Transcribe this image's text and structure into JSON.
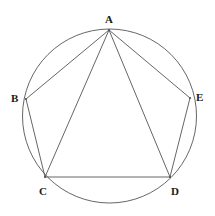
{
  "figure": {
    "type": "geometric-diagram",
    "canvas": {
      "width": 215,
      "height": 216
    },
    "stroke_color": "#555555",
    "label_color": "#1a1a1a",
    "background_color": "#ffffff",
    "stroke_width": 0.9,
    "circle": {
      "name": "circumscribed-circle",
      "center_x": 109.5,
      "center_y": 116,
      "radius": 87,
      "fill": "none"
    },
    "vertices": [
      {
        "id": "A",
        "label": "A",
        "x": 109,
        "y": 30,
        "label_x": 105,
        "label_y": 14,
        "position": "top"
      },
      {
        "id": "B",
        "label": "B",
        "x": 26,
        "y": 99,
        "label_x": 11,
        "label_y": 93,
        "position": "left"
      },
      {
        "id": "C",
        "label": "C",
        "x": 45,
        "y": 177,
        "label_x": 39,
        "label_y": 186,
        "position": "bottom-left"
      },
      {
        "id": "D",
        "label": "D",
        "x": 170,
        "y": 177,
        "label_x": 171,
        "label_y": 186,
        "position": "bottom-right"
      },
      {
        "id": "E",
        "label": "E",
        "x": 190,
        "y": 98,
        "label_x": 196,
        "label_y": 92,
        "position": "right"
      }
    ],
    "segments": [
      {
        "name": "side-AB",
        "from": "A",
        "to": "B",
        "kind": "pentagon-side"
      },
      {
        "name": "side-BC",
        "from": "B",
        "to": "C",
        "kind": "pentagon-side"
      },
      {
        "name": "side-CD",
        "from": "C",
        "to": "D",
        "kind": "pentagon-side"
      },
      {
        "name": "side-DE",
        "from": "D",
        "to": "E",
        "kind": "pentagon-side"
      },
      {
        "name": "side-EA",
        "from": "E",
        "to": "A",
        "kind": "pentagon-side"
      },
      {
        "name": "diagonal-AC",
        "from": "A",
        "to": "C",
        "kind": "diagonal"
      },
      {
        "name": "diagonal-AD",
        "from": "A",
        "to": "D",
        "kind": "diagonal"
      }
    ]
  }
}
